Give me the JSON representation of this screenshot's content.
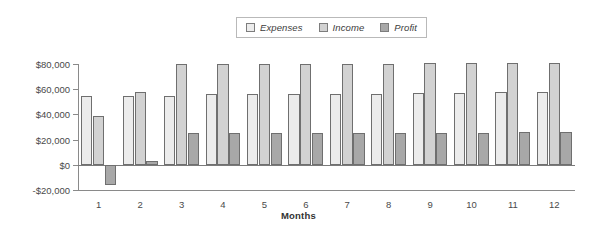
{
  "legend": {
    "position": "top-center",
    "entries": [
      {
        "label": "Expenses",
        "color": "#ececec"
      },
      {
        "label": "Income",
        "color": "#d2d2d2"
      },
      {
        "label": "Profit",
        "color": "#a8a8a8"
      }
    ]
  },
  "chart_data": {
    "type": "bar",
    "title": "",
    "subtitle": "",
    "xlabel": "Months",
    "ylabel": "",
    "grid": false,
    "legend_position": "top-center",
    "categories": [
      "1",
      "2",
      "3",
      "4",
      "5",
      "6",
      "7",
      "8",
      "9",
      "10",
      "11",
      "12"
    ],
    "ylim": [
      -20000,
      80000
    ],
    "ytick_values": [
      -20000,
      0,
      20000,
      40000,
      60000,
      80000
    ],
    "ytick_labels": [
      "-$20,000",
      "$0",
      "$20,000",
      "$40,000",
      "$60,000",
      "$80,000"
    ],
    "series": [
      {
        "name": "Expenses",
        "color": "#ececec",
        "values": [
          55000,
          55000,
          55000,
          56000,
          56000,
          56000,
          56500,
          56500,
          57000,
          57000,
          57500,
          57500
        ]
      },
      {
        "name": "Income",
        "color": "#d2d2d2",
        "values": [
          39000,
          58000,
          80000,
          80000,
          80000,
          80000,
          80000,
          80000,
          80500,
          80500,
          80500,
          81000
        ]
      },
      {
        "name": "Profit",
        "color": "#a8a8a8",
        "values": [
          -16000,
          3000,
          25000,
          25000,
          25000,
          25000,
          25000,
          25000,
          25500,
          25500,
          26000,
          26000
        ]
      }
    ]
  },
  "axis_title": "Months"
}
